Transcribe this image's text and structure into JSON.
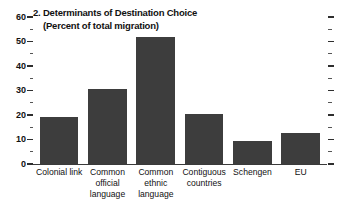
{
  "chart_data": {
    "type": "bar",
    "title": "2. Determinants of Destination Choice",
    "subtitle": "(Percent of total migration)",
    "xlabel": "",
    "ylabel": "",
    "ylim": [
      0,
      60
    ],
    "ytick_values": [
      0,
      10,
      20,
      30,
      40,
      50,
      60
    ],
    "ytick_labels": [
      "0",
      "10",
      "20",
      "30",
      "40",
      "50",
      "60"
    ],
    "yminor_values": [
      5,
      15,
      25,
      35,
      45,
      55
    ],
    "grid": false,
    "legend": null,
    "bar_color": "#3d3d3d",
    "background_color": "#ffffff",
    "categories": [
      "Colonial link",
      "Common official language",
      "Common ethnic language",
      "Contiguous countries",
      "Schengen",
      "EU"
    ],
    "category_lines": [
      [
        "Colonial link"
      ],
      [
        "Common",
        "official",
        "language"
      ],
      [
        "Common",
        "ethnic",
        "language"
      ],
      [
        "Contiguous",
        "countries"
      ],
      [
        "Schengen"
      ],
      [
        "EU"
      ]
    ],
    "values": [
      19,
      30.5,
      52,
      20.5,
      9.5,
      12.5
    ]
  }
}
